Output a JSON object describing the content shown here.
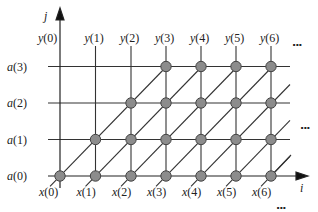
{
  "diagram": {
    "type": "index-space grid / systolic array dependency graph",
    "axes": {
      "horizontal": "i",
      "vertical": "j"
    },
    "column_labels_top": [
      "y(0)",
      "y(1)",
      "y(2)",
      "y(3)",
      "y(4)",
      "y(5)",
      "y(6)"
    ],
    "column_labels_bottom": [
      "x(0)",
      "x(1)",
      "x(2)",
      "x(3)",
      "x(4)",
      "x(5)",
      "x(6)"
    ],
    "row_labels": [
      "a(0)",
      "a(1)",
      "a(2)",
      "a(3)"
    ],
    "ellipsis": "...",
    "nodes_per_row": [
      {
        "row": "a(0)",
        "columns": [
          0,
          1,
          2,
          3,
          4,
          5,
          6
        ]
      },
      {
        "row": "a(1)",
        "columns": [
          1,
          2,
          3,
          4,
          5,
          6
        ]
      },
      {
        "row": "a(2)",
        "columns": [
          2,
          3,
          4,
          5,
          6
        ]
      },
      {
        "row": "a(3)",
        "columns": [
          3,
          4,
          5,
          6
        ]
      }
    ],
    "colors": {
      "line": "#333333",
      "node_fill": "#8c8c8c",
      "node_stroke": "#444444"
    }
  }
}
